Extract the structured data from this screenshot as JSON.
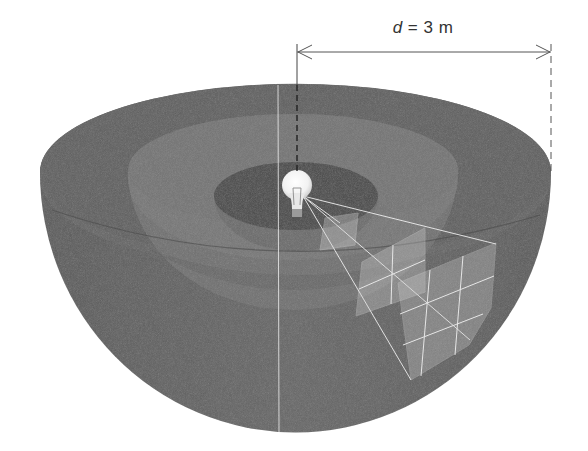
{
  "figure": {
    "dimension": {
      "variable": "d",
      "equals": "=",
      "value": "3",
      "unit": "m"
    },
    "elements": {
      "outer_shell": "outer hemisphere (radius d)",
      "middle_shell": "middle hemisphere",
      "inner_shell": "inner hemisphere",
      "light_source": "light-bulb",
      "grid_patches": [
        "1 cell on inner shell",
        "2x2 cells on middle shell",
        "3x3 cells on outer shell"
      ]
    },
    "colors": {
      "outer_shell": "#5e5e5e",
      "outer_rim_top": "#616161",
      "middle_shell": "#6f6f6f",
      "inner_shell": "#4f4f4f",
      "grid_lines": "#e6e6e6",
      "dimension_line": "#555555"
    }
  }
}
